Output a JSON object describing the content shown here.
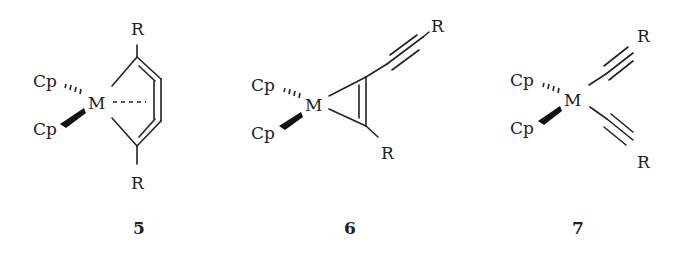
{
  "figure": {
    "structures": [
      {
        "id": "5",
        "label": "5",
        "metal": "M",
        "ligands": [
          "Cp",
          "Cp"
        ],
        "substituents": [
          "R",
          "R"
        ],
        "type": "metallacyclocumulene"
      },
      {
        "id": "6",
        "label": "6",
        "metal": "M",
        "ligands": [
          "Cp",
          "Cp"
        ],
        "substituents": [
          "R",
          "R"
        ],
        "type": "metallacyclopropene (alkyne complex) with alkynyl"
      },
      {
        "id": "7",
        "label": "7",
        "metal": "M",
        "ligands": [
          "Cp",
          "Cp"
        ],
        "substituents": [
          "R",
          "R"
        ],
        "type": "bis(alkynyl) complex"
      }
    ]
  },
  "s5": {
    "cp1": "Cp",
    "cp2": "Cp",
    "metal": "M",
    "r_top": "R",
    "r_bottom": "R",
    "label": "5"
  },
  "s6": {
    "cp1": "Cp",
    "cp2": "Cp",
    "metal": "M",
    "r_top": "R",
    "r_bottom": "R",
    "label": "6"
  },
  "s7": {
    "cp1": "Cp",
    "cp2": "Cp",
    "metal": "M",
    "r_top": "R",
    "r_bottom": "R",
    "label": "7"
  }
}
